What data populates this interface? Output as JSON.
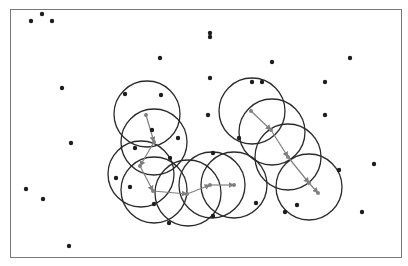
{
  "diagram": {
    "type": "mean-shift-trajectories",
    "colors": {
      "frame": "#777777",
      "point": "#1e1e1e",
      "circle": "#2a2a2a",
      "arrow": "#808080",
      "background": "#ffffff"
    },
    "points": [
      [
        31,
        21
      ],
      [
        42,
        14
      ],
      [
        52,
        21
      ],
      [
        160,
        58
      ],
      [
        62,
        88
      ],
      [
        125,
        94
      ],
      [
        161,
        95
      ],
      [
        71,
        143
      ],
      [
        26,
        189
      ],
      [
        43,
        199
      ],
      [
        69,
        246
      ],
      [
        210,
        33
      ],
      [
        210,
        37
      ],
      [
        210,
        78
      ],
      [
        252,
        82
      ],
      [
        262,
        82
      ],
      [
        272,
        62
      ],
      [
        350,
        58
      ],
      [
        325,
        82
      ],
      [
        325,
        115
      ],
      [
        208,
        115
      ],
      [
        178,
        138
      ],
      [
        135,
        148
      ],
      [
        170,
        158
      ],
      [
        116,
        178
      ],
      [
        130,
        187
      ],
      [
        213,
        153
      ],
      [
        256,
        203
      ],
      [
        285,
        212
      ],
      [
        297,
        205
      ],
      [
        339,
        170
      ],
      [
        374,
        164
      ],
      [
        362,
        212
      ],
      [
        213,
        216
      ],
      [
        169,
        223
      ],
      [
        154,
        204
      ],
      [
        239,
        138
      ],
      [
        152,
        130
      ]
    ],
    "trajectories": [
      {
        "name": "trajectory-left",
        "steps": [
          [
            146,
            115
          ],
          [
            154,
            142
          ],
          [
            140,
            166
          ],
          [
            153,
            191
          ],
          [
            187,
            194
          ],
          [
            210,
            185
          ],
          [
            234,
            185
          ]
        ]
      },
      {
        "name": "trajectory-right",
        "steps": [
          [
            251,
            111
          ],
          [
            271,
            130
          ],
          [
            288,
            157
          ],
          [
            309,
            183
          ],
          [
            318,
            193
          ]
        ]
      }
    ],
    "windows": [
      [
        147,
        114
      ],
      [
        154,
        142
      ],
      [
        141,
        174
      ],
      [
        154,
        190
      ],
      [
        188,
        193
      ],
      [
        212,
        185
      ],
      [
        234,
        185
      ],
      [
        252,
        111
      ],
      [
        272,
        132
      ],
      [
        288,
        157
      ],
      [
        309,
        187
      ]
    ],
    "window_radius_units": 33
  }
}
